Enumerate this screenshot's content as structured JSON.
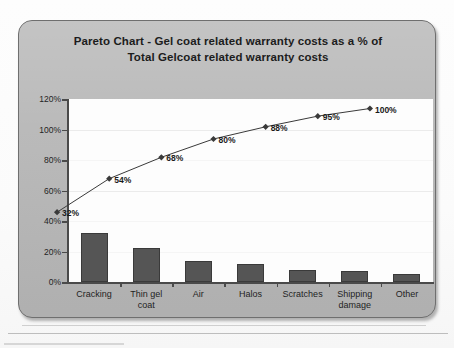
{
  "chart_data": {
    "type": "bar",
    "title": "Pareto Chart - Gel coat related warranty costs as a % of Total Gelcoat related warranty costs",
    "title_line1": "Pareto Chart - Gel coat related warranty costs as a % of",
    "title_line2": "Total Gelcoat related warranty costs",
    "xlabel": "",
    "ylabel": "",
    "ylim": [
      0,
      120
    ],
    "grid": false,
    "legend": "none",
    "categories": [
      "Cracking",
      "Thin gel coat",
      "Air",
      "Halos",
      "Scratches",
      "Shipping damage",
      "Other"
    ],
    "category_lines": [
      [
        "Cracking"
      ],
      [
        "Thin gel",
        "coat"
      ],
      [
        "Air"
      ],
      [
        "Halos"
      ],
      [
        "Scratches"
      ],
      [
        "Shipping",
        "damage"
      ],
      [
        "Other"
      ]
    ],
    "series": [
      {
        "name": "Percent of total warranty cost",
        "type": "bar",
        "values": [
          32,
          22,
          14,
          12,
          8,
          7,
          5
        ]
      },
      {
        "name": "Cumulative percent",
        "type": "line",
        "values": [
          32,
          54,
          68,
          80,
          88,
          95,
          100
        ],
        "labels": [
          "32%",
          "54%",
          "68%",
          "80%",
          "88%",
          "95%",
          "100%"
        ]
      }
    ],
    "y_ticks": [
      0,
      20,
      40,
      60,
      80,
      100,
      120
    ],
    "y_tick_labels": [
      "0%",
      "20%",
      "40%",
      "60%",
      "80%",
      "100%",
      "120%"
    ],
    "colors": {
      "bar": "#555555",
      "line": "#3a3a3a",
      "panel": "#b9b9b9",
      "plot": "#fdfdfd",
      "axis": "#4a4a4a",
      "text": "#1c1c1c"
    }
  }
}
